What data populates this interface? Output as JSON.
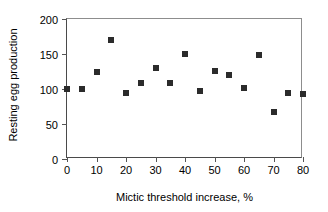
{
  "chart_data": {
    "type": "scatter",
    "title": "",
    "xlabel": "Mictic threshold increase, %",
    "ylabel": "Resting egg production",
    "xlim": [
      0,
      80
    ],
    "ylim": [
      0,
      200
    ],
    "xticks": [
      0,
      10,
      20,
      30,
      40,
      50,
      60,
      70,
      80
    ],
    "yticks": [
      0,
      50,
      100,
      150,
      200
    ],
    "grid": false,
    "legend": false,
    "marker": "square",
    "marker_color": "#2b2b2b",
    "x": [
      0,
      5,
      10,
      15,
      20,
      25,
      30,
      35,
      40,
      45,
      50,
      55,
      60,
      65,
      70,
      75,
      80
    ],
    "y": [
      100,
      100,
      124,
      170,
      95,
      108,
      130,
      109,
      150,
      97,
      126,
      120,
      102,
      149,
      67,
      95,
      93
    ],
    "points": [
      {
        "x": 0,
        "y": 100
      },
      {
        "x": 5,
        "y": 100
      },
      {
        "x": 10,
        "y": 124
      },
      {
        "x": 15,
        "y": 170
      },
      {
        "x": 20,
        "y": 95
      },
      {
        "x": 25,
        "y": 108
      },
      {
        "x": 30,
        "y": 130
      },
      {
        "x": 35,
        "y": 109
      },
      {
        "x": 40,
        "y": 150
      },
      {
        "x": 45,
        "y": 97
      },
      {
        "x": 50,
        "y": 126
      },
      {
        "x": 55,
        "y": 120
      },
      {
        "x": 60,
        "y": 102
      },
      {
        "x": 65,
        "y": 149
      },
      {
        "x": 70,
        "y": 67
      },
      {
        "x": 75,
        "y": 95
      },
      {
        "x": 80,
        "y": 93
      }
    ]
  },
  "axis_labels": {
    "x_title": "Mictic threshold increase, %",
    "y_title": "Resting egg production"
  }
}
